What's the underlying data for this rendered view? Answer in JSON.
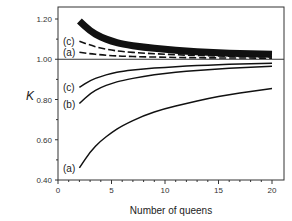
{
  "chart_data": {
    "type": "line",
    "title": "",
    "xlabel": "Number of queens",
    "ylabel": "K",
    "xlim": [
      0,
      20
    ],
    "ylim": [
      0.4,
      1.25
    ],
    "x_ticks": [
      "0",
      "5",
      "10",
      "15",
      "20"
    ],
    "y_ticks": [
      "0.40",
      "0.60",
      "0.80",
      "1.00",
      "1.20"
    ],
    "grid": false,
    "legend": "inline labels at left end of curves",
    "reference_line": 1.0,
    "x": [
      2,
      3,
      4,
      5,
      6,
      8,
      10,
      12,
      14,
      16,
      18,
      20
    ],
    "series": [
      {
        "name": "upper thick (b)",
        "label": "",
        "style": "thick-solid",
        "values": [
          1.19,
          1.14,
          1.11,
          1.09,
          1.075,
          1.06,
          1.05,
          1.04,
          1.035,
          1.03,
          1.027,
          1.025
        ]
      },
      {
        "name": "upper (c)",
        "label": "(c)",
        "style": "dashed",
        "values": [
          1.09,
          1.07,
          1.055,
          1.045,
          1.038,
          1.03,
          1.025,
          1.02,
          1.017,
          1.015,
          1.013,
          1.012
        ]
      },
      {
        "name": "upper (a)",
        "label": "(a)",
        "style": "dashed",
        "values": [
          1.035,
          1.027,
          1.022,
          1.018,
          1.015,
          1.012,
          1.01,
          1.008,
          1.007,
          1.006,
          1.006,
          1.005
        ]
      },
      {
        "name": "lower (c)",
        "label": "(c)",
        "style": "solid",
        "values": [
          0.86,
          0.895,
          0.915,
          0.93,
          0.94,
          0.952,
          0.96,
          0.966,
          0.971,
          0.975,
          0.978,
          0.98
        ]
      },
      {
        "name": "lower (b)",
        "label": "(b)",
        "style": "solid",
        "values": [
          0.78,
          0.83,
          0.86,
          0.88,
          0.895,
          0.915,
          0.93,
          0.94,
          0.948,
          0.955,
          0.96,
          0.965
        ]
      },
      {
        "name": "lower (a)",
        "label": "(a)",
        "style": "solid",
        "values": [
          0.46,
          0.54,
          0.595,
          0.635,
          0.67,
          0.72,
          0.755,
          0.78,
          0.805,
          0.825,
          0.84,
          0.855
        ]
      }
    ]
  },
  "labels": {
    "xlabel": "Number of queens",
    "ylabel": "K",
    "x_ticks": [
      "0",
      "5",
      "10",
      "15",
      "20"
    ],
    "y_ticks": [
      "0.40",
      "0.60",
      "0.80",
      "1.00",
      "1.20"
    ],
    "curve_labels": [
      "(c)",
      "(a)",
      "(c)",
      "(b)",
      "(a)"
    ]
  }
}
